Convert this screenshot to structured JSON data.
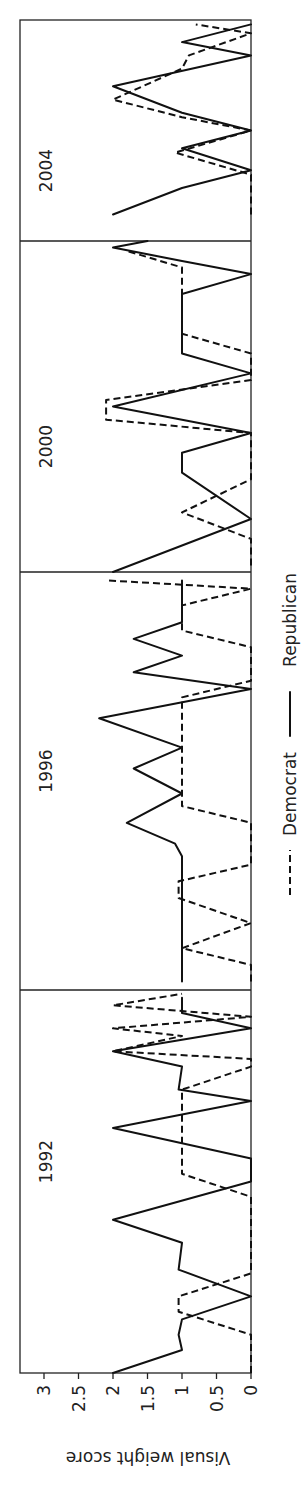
{
  "chart_data": {
    "type": "line",
    "orientation": "rotated-90-ccw",
    "ylabel": "Visual weight score",
    "xlabel": "",
    "ylim": [
      0,
      3
    ],
    "yticks": [
      "0",
      "0.5",
      "1",
      "1.5",
      "2",
      "2.5",
      "3"
    ],
    "grid": false,
    "legend": {
      "position": "bottom",
      "entries": [
        {
          "name": "Democrat",
          "style": "dashed"
        },
        {
          "name": "Republican",
          "style": "solid"
        }
      ]
    },
    "panels": [
      {
        "title": "1992",
        "series": [
          {
            "name": "Republican",
            "points": [
              [
                0.0,
                2.0
              ],
              [
                0.06,
                1.0
              ],
              [
                0.1,
                1.05
              ],
              [
                0.14,
                1.0
              ],
              [
                0.2,
                0.0
              ],
              [
                0.27,
                1.05
              ],
              [
                0.34,
                1.0
              ],
              [
                0.4,
                2.0
              ],
              [
                0.5,
                0.0
              ],
              [
                0.56,
                0.0
              ],
              [
                0.64,
                2.0
              ],
              [
                0.71,
                0.0
              ],
              [
                0.74,
                1.05
              ],
              [
                0.8,
                1.0
              ],
              [
                0.84,
                2.0
              ],
              [
                0.9,
                0.0
              ],
              [
                0.94,
                1.0
              ],
              [
                0.98,
                1.0
              ]
            ]
          },
          {
            "name": "Democrat",
            "points": [
              [
                0.0,
                0.0
              ],
              [
                0.1,
                0.0
              ],
              [
                0.16,
                1.05
              ],
              [
                0.2,
                1.05
              ],
              [
                0.26,
                0.0
              ],
              [
                0.46,
                0.0
              ],
              [
                0.52,
                1.0
              ],
              [
                0.7,
                1.0
              ],
              [
                0.74,
                1.0
              ],
              [
                0.8,
                0.0
              ],
              [
                0.82,
                0.0
              ],
              [
                0.84,
                2.0
              ],
              [
                0.88,
                1.0
              ],
              [
                0.9,
                2.0
              ],
              [
                0.93,
                0.0
              ],
              [
                0.96,
                2.0
              ],
              [
                0.99,
                1.0
              ]
            ]
          }
        ]
      },
      {
        "title": "1996",
        "series": [
          {
            "name": "Republican",
            "points": [
              [
                0.02,
                1.0
              ],
              [
                0.32,
                1.0
              ],
              [
                0.35,
                1.1
              ],
              [
                0.4,
                1.8
              ],
              [
                0.47,
                1.0
              ],
              [
                0.53,
                1.7
              ],
              [
                0.58,
                1.0
              ],
              [
                0.65,
                2.2
              ],
              [
                0.72,
                0.0
              ],
              [
                0.76,
                1.7
              ],
              [
                0.8,
                1.0
              ],
              [
                0.84,
                1.7
              ],
              [
                0.88,
                1.0
              ],
              [
                0.96,
                1.0
              ],
              [
                0.98,
                1.0
              ]
            ]
          },
          {
            "name": "Democrat",
            "points": [
              [
                0.02,
                0.0
              ],
              [
                0.06,
                0.0
              ],
              [
                0.1,
                1.0
              ],
              [
                0.16,
                0.0
              ],
              [
                0.22,
                1.05
              ],
              [
                0.26,
                1.05
              ],
              [
                0.3,
                0.0
              ],
              [
                0.4,
                0.0
              ],
              [
                0.44,
                1.0
              ],
              [
                0.7,
                1.0
              ],
              [
                0.74,
                0.0
              ],
              [
                0.82,
                0.0
              ],
              [
                0.86,
                1.0
              ],
              [
                0.92,
                1.0
              ],
              [
                0.96,
                0.0
              ],
              [
                0.98,
                2.1
              ]
            ]
          }
        ]
      },
      {
        "title": "2000",
        "series": [
          {
            "name": "Republican",
            "points": [
              [
                0.0,
                2.0
              ],
              [
                0.16,
                0.0
              ],
              [
                0.3,
                1.0
              ],
              [
                0.36,
                1.0
              ],
              [
                0.42,
                0.0
              ],
              [
                0.5,
                2.0
              ],
              [
                0.6,
                0.0
              ],
              [
                0.66,
                1.0
              ],
              [
                0.84,
                1.0
              ],
              [
                0.9,
                0.0
              ],
              [
                0.94,
                1.0
              ],
              [
                0.98,
                2.0
              ],
              [
                1.0,
                1.5
              ]
            ]
          },
          {
            "name": "Democrat",
            "points": [
              [
                0.02,
                0.0
              ],
              [
                0.1,
                0.0
              ],
              [
                0.18,
                1.0
              ],
              [
                0.28,
                0.0
              ],
              [
                0.42,
                0.0
              ],
              [
                0.46,
                2.1
              ],
              [
                0.52,
                2.1
              ],
              [
                0.58,
                0.0
              ],
              [
                0.66,
                0.0
              ],
              [
                0.72,
                1.0
              ],
              [
                0.92,
                1.0
              ],
              [
                0.97,
                1.8
              ]
            ]
          }
        ]
      },
      {
        "title": "2004",
        "series": [
          {
            "name": "Republican",
            "points": [
              [
                0.12,
                2.0
              ],
              [
                0.24,
                1.0
              ],
              [
                0.32,
                0.0
              ],
              [
                0.42,
                1.0
              ],
              [
                0.5,
                0.0
              ],
              [
                0.58,
                1.0
              ],
              [
                0.7,
                2.0
              ],
              [
                0.84,
                0.0
              ],
              [
                0.9,
                1.0
              ],
              [
                0.98,
                0.0
              ]
            ]
          },
          {
            "name": "Democrat",
            "points": [
              [
                0.12,
                0.0
              ],
              [
                0.3,
                0.0
              ],
              [
                0.4,
                1.1
              ],
              [
                0.5,
                0.0
              ],
              [
                0.56,
                1.0
              ],
              [
                0.64,
                2.0
              ],
              [
                0.78,
                1.0
              ],
              [
                0.84,
                0.9
              ],
              [
                0.94,
                0.0
              ],
              [
                0.98,
                0.8
              ]
            ]
          }
        ]
      }
    ]
  },
  "layout": {
    "axis": {
      "x_zero": 251,
      "x_per_unit": 69,
      "bottom_y": 1373,
      "top_y": 20,
      "left_x": 20
    },
    "panel_y_bounds": [
      [
        1373,
        990
      ],
      [
        990,
        572
      ],
      [
        572,
        241
      ],
      [
        241,
        20
      ]
    ]
  },
  "axis": {
    "title": "Visual weight score"
  },
  "legend": {
    "democrat": "Democrat",
    "republican": "Republican"
  }
}
